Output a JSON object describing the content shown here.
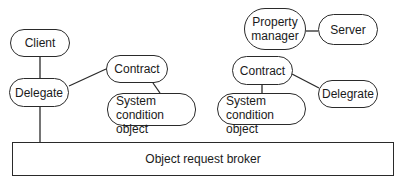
{
  "diagram": {
    "nodes": {
      "client": {
        "label": "Client"
      },
      "delegate_left": {
        "label": "Delegate"
      },
      "contract_left": {
        "label": "Contract"
      },
      "sco_left": {
        "line1": "System",
        "line2": "condition object"
      },
      "property_manager": {
        "line1": "Property",
        "line2": "manager"
      },
      "server": {
        "label": "Server"
      },
      "contract_right": {
        "label": "Contract"
      },
      "delegrate_right": {
        "label": "Delegrate"
      },
      "sco_right": {
        "line1": "System",
        "line2": "condition object"
      },
      "orb": {
        "label": "Object request broker"
      }
    },
    "edges": [
      {
        "from": "client",
        "to": "delegate_left"
      },
      {
        "from": "delegate_left",
        "to": "contract_left"
      },
      {
        "from": "contract_left",
        "to": "sco_left"
      },
      {
        "from": "delegate_left",
        "to": "orb"
      },
      {
        "from": "property_manager",
        "to": "server"
      },
      {
        "from": "contract_right",
        "to": "sco_right"
      },
      {
        "from": "contract_right",
        "to": "delegrate_right"
      }
    ],
    "colors": {
      "stroke": "#2a2a2a",
      "background": "#ffffff",
      "text": "#1a1a1a"
    }
  }
}
